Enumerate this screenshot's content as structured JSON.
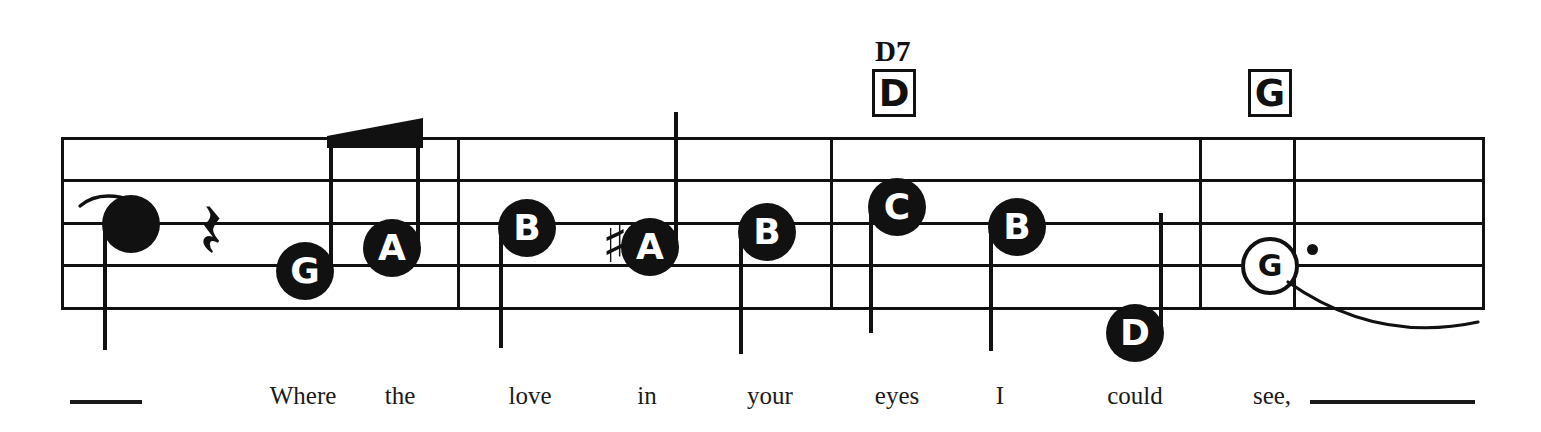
{
  "score": {
    "type": "music-notation-staff",
    "clef_shown": false,
    "staff": {
      "left": 62,
      "right": 1483,
      "top_line_y": 138,
      "line_spacing": 42.5,
      "line_count": 5
    },
    "barlines_x": [
      62,
      458,
      831,
      1200,
      1294,
      1483
    ],
    "notes": [
      {
        "id": "n1",
        "label": "",
        "head": "filled-plain",
        "cx": 131,
        "cy": 224,
        "stem": "down",
        "stem_len": 126,
        "tie_in": true
      },
      {
        "id": "n2",
        "label": "G",
        "head": "lettered",
        "cx": 305,
        "cy": 271,
        "stem": "up",
        "stem_len": 134,
        "beamed": true
      },
      {
        "id": "n3",
        "label": "A",
        "head": "lettered",
        "cx": 392,
        "cy": 248,
        "stem": "up",
        "stem_len": 124,
        "beamed": true
      },
      {
        "id": "n4",
        "label": "B",
        "head": "lettered",
        "cx": 527,
        "cy": 228,
        "stem": "down",
        "stem_len": 120
      },
      {
        "id": "n5",
        "label": "A",
        "head": "lettered",
        "cx": 650,
        "cy": 247,
        "stem": "up",
        "stem_len": 135,
        "accidental": "sharp"
      },
      {
        "id": "n6",
        "label": "B",
        "head": "lettered",
        "cx": 767,
        "cy": 232,
        "stem": "down",
        "stem_len": 122
      },
      {
        "id": "n7",
        "label": "C",
        "head": "lettered",
        "cx": 897,
        "cy": 207,
        "stem": "down",
        "stem_len": 126
      },
      {
        "id": "n8",
        "label": "B",
        "head": "lettered",
        "cx": 1017,
        "cy": 227,
        "stem": "down",
        "stem_len": 124
      },
      {
        "id": "n9",
        "label": "D",
        "head": "lettered",
        "cx": 1135,
        "cy": 333,
        "stem": "up",
        "stem_len": 120
      },
      {
        "id": "n10",
        "label": "G",
        "head": "open",
        "cx": 1270,
        "cy": 266,
        "stem": "none",
        "dotted": true,
        "tie_out": true
      }
    ],
    "rests": [
      {
        "id": "r1",
        "glyph": "quarter-rest",
        "cx": 215,
        "cy": 232
      }
    ],
    "chords": [
      {
        "id": "c1",
        "box_label": "D",
        "superscript": "D7",
        "box_x": 872,
        "box_y": 69
      },
      {
        "id": "c2",
        "box_label": "G",
        "superscript": "",
        "box_x": 1248,
        "box_y": 69
      }
    ],
    "lyrics": [
      {
        "text": "Where",
        "x": 303
      },
      {
        "text": "the",
        "x": 400
      },
      {
        "text": "love",
        "x": 530
      },
      {
        "text": "in",
        "x": 647
      },
      {
        "text": "your",
        "x": 770
      },
      {
        "text": "eyes",
        "x": 897
      },
      {
        "text": "I",
        "x": 1000
      },
      {
        "text": "could",
        "x": 1135
      },
      {
        "text": "see,",
        "x": 1272
      }
    ],
    "lyric_extensions": [
      {
        "id": "ext-left",
        "x": 70,
        "width": 72,
        "y": 400
      },
      {
        "id": "ext-right",
        "x": 1310,
        "width": 165,
        "y": 400
      }
    ]
  },
  "colors": {
    "ink": "#111111",
    "paper": "#ffffff",
    "lyric_ink": "#1a1a1a"
  }
}
